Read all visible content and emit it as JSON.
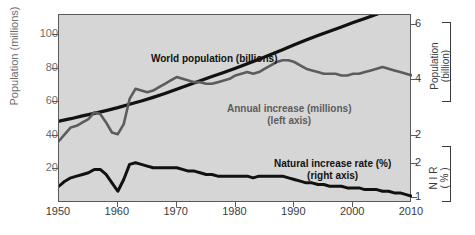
{
  "chart_data": {
    "type": "line",
    "title": "",
    "subtitle": "",
    "xlabel": "",
    "ylabel": "Population (millions)",
    "ylabel_right_top": "Population (billion)",
    "ylabel_right_bottom": "NIR (%)",
    "xlim": [
      1950,
      2010
    ],
    "ylim": [
      0,
      112
    ],
    "xticks": [
      "1950",
      "1960",
      "1970",
      "1980",
      "1990",
      "2000",
      "2010"
    ],
    "xtick_values": [
      1950,
      1960,
      1970,
      1980,
      1990,
      2000,
      2010
    ],
    "yticks_left": [
      "20",
      "40",
      "60",
      "80",
      "100"
    ],
    "ytick_values_left": [
      20,
      40,
      60,
      80,
      100
    ],
    "yticks_right_top": [
      "2",
      "4",
      "6"
    ],
    "ytick_values_right_top": [
      2,
      4,
      6
    ],
    "yticks_right_bottom": [
      "1",
      "2"
    ],
    "ytick_values_right_bottom": [
      1,
      2
    ],
    "grid": false,
    "legend_position": "inline-annotations",
    "background_color": "#d6d6d6",
    "series": [
      {
        "name": "World population (billions)",
        "annotation": "World population (billions)",
        "axis": "right-top",
        "color": "#111111",
        "x": [
          1950,
          1952,
          1954,
          1956,
          1958,
          1960,
          1962,
          1964,
          1966,
          1968,
          1970,
          1972,
          1974,
          1976,
          1978,
          1980,
          1982,
          1984,
          1986,
          1988,
          1990,
          1992,
          1994,
          1996,
          1998,
          2000,
          2002,
          2004,
          2006,
          2008,
          2010
        ],
        "values": [
          2.53,
          2.62,
          2.72,
          2.81,
          2.91,
          3.02,
          3.14,
          3.26,
          3.39,
          3.53,
          3.68,
          3.84,
          3.99,
          4.14,
          4.29,
          4.44,
          4.6,
          4.77,
          4.94,
          5.11,
          5.29,
          5.46,
          5.62,
          5.78,
          5.93,
          6.09,
          6.24,
          6.39,
          6.55,
          6.72,
          6.92
        ]
      },
      {
        "name": "Annual increase (millions)",
        "annotation": "Annual increase (millions)",
        "annotation_sub": "(left axis)",
        "axis": "left",
        "color": "#5c5c5c",
        "x": [
          1950,
          1951,
          1952,
          1953,
          1954,
          1955,
          1956,
          1957,
          1958,
          1959,
          1960,
          1961,
          1962,
          1963,
          1964,
          1965,
          1966,
          1967,
          1968,
          1969,
          1970,
          1971,
          1972,
          1973,
          1974,
          1975,
          1976,
          1977,
          1978,
          1979,
          1980,
          1981,
          1982,
          1983,
          1984,
          1985,
          1986,
          1987,
          1988,
          1989,
          1990,
          1991,
          1992,
          1993,
          1994,
          1995,
          1996,
          1997,
          1998,
          1999,
          2000,
          2001,
          2002,
          2003,
          2004,
          2005,
          2006,
          2007,
          2008,
          2009,
          2010
        ],
        "values": [
          37,
          41,
          45,
          46,
          48,
          50,
          54,
          53,
          48,
          42,
          41,
          47,
          62,
          68,
          67,
          66,
          67,
          69,
          71,
          73,
          75,
          74,
          73,
          72,
          72,
          71,
          71,
          72,
          73,
          74,
          76,
          77,
          78,
          77,
          78,
          80,
          82,
          84,
          85,
          85,
          84,
          82,
          80,
          79,
          78,
          77,
          77,
          77,
          76,
          76,
          77,
          77,
          78,
          79,
          80,
          81,
          80,
          79,
          78,
          77,
          76
        ]
      },
      {
        "name": "Natural increase rate (%)",
        "annotation": "Natural increase rate (%)",
        "annotation_sub": "(right axis)",
        "axis": "right-bottom",
        "color": "#111111",
        "x": [
          1950,
          1951,
          1952,
          1953,
          1954,
          1955,
          1956,
          1957,
          1958,
          1959,
          1960,
          1961,
          1962,
          1963,
          1964,
          1965,
          1966,
          1967,
          1968,
          1969,
          1970,
          1971,
          1972,
          1973,
          1974,
          1975,
          1976,
          1977,
          1978,
          1979,
          1980,
          1981,
          1982,
          1983,
          1984,
          1985,
          1986,
          1987,
          1988,
          1989,
          1990,
          1991,
          1992,
          1993,
          1994,
          1995,
          1996,
          1997,
          1998,
          1999,
          2000,
          2001,
          2002,
          2003,
          2004,
          2005,
          2006,
          2007,
          2008,
          2009,
          2010
        ],
        "values_plotpos": [
          10,
          13,
          15,
          16,
          17,
          18,
          20,
          20,
          17,
          12,
          7,
          14,
          23,
          24,
          23,
          22,
          21,
          21,
          21,
          21,
          21,
          20,
          19,
          19,
          18,
          17,
          17,
          16,
          16,
          16,
          16,
          16,
          16,
          15,
          16,
          16,
          16,
          16,
          16,
          15,
          14,
          13,
          12,
          12,
          11,
          11,
          10,
          10,
          10,
          9,
          9,
          9,
          8,
          8,
          8,
          7,
          7,
          6,
          6,
          5,
          4
        ]
      }
    ]
  },
  "annotations": {
    "world_population": "World population (billions)",
    "annual_increase_line1": "Annual increase (millions)",
    "annual_increase_line2": "(left axis)",
    "nir_line1": "Natural increase rate (%)",
    "nir_line2": "(right axis)"
  },
  "axes": {
    "left_title": "Population (millions)",
    "right_top_title_line1": "Population",
    "right_top_title_line2": "(billion)",
    "right_bottom_title_line1": "N I R",
    "right_bottom_title_line2": "( % )"
  }
}
